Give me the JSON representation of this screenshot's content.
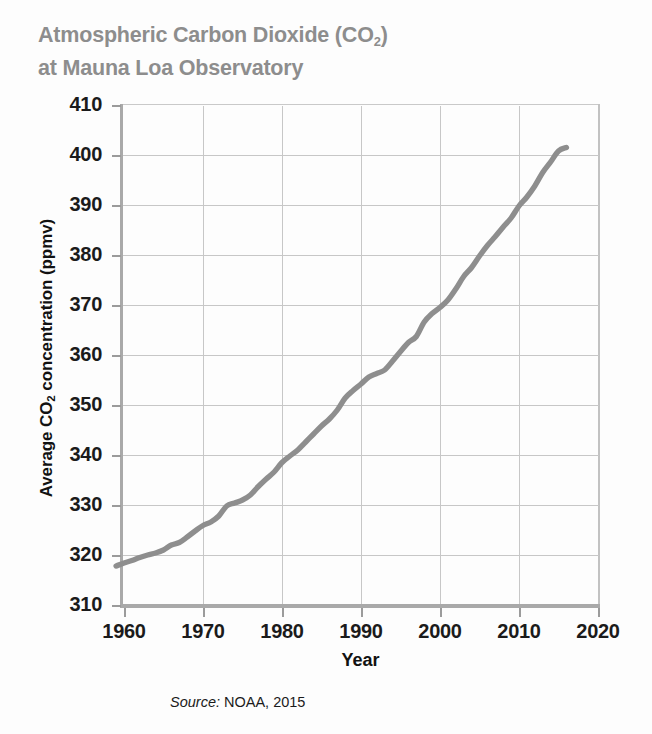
{
  "figure": {
    "title_line1": "Atmospheric Carbon Dioxide (CO",
    "title_sub": "2",
    "title_line1_end": ")",
    "title_line2": "at Mauna Loa Observatory",
    "title_color": "#8d8d8d",
    "background_color": "#fdfdfd",
    "source_label": "Source:",
    "source_value": " NOAA, 2015"
  },
  "axis": {
    "ylabel_pre": "Average CO",
    "ylabel_sub": "2",
    "ylabel_post": " concentration (ppmv)",
    "xlabel": "Year",
    "yticks": [
      "410",
      "400",
      "390",
      "380",
      "370",
      "360",
      "350",
      "340",
      "330",
      "320",
      "310"
    ],
    "xticks": [
      "1960",
      "1970",
      "1980",
      "1990",
      "2000",
      "2010",
      "2020"
    ]
  },
  "chart_data": {
    "type": "line",
    "xlabel": "Year",
    "ylabel": "Average CO2 concentration (ppmv)",
    "xlim": [
      1960,
      2020
    ],
    "ylim": [
      310,
      410
    ],
    "xticks": [
      1960,
      1970,
      1980,
      1990,
      2000,
      2010,
      2020
    ],
    "yticks": [
      310,
      320,
      330,
      340,
      350,
      360,
      370,
      380,
      390,
      400,
      410
    ],
    "grid": true,
    "legend": null,
    "line_color": "#8e8e8e",
    "source": "NOAA, 2015",
    "series": [
      {
        "name": "Average CO2 concentration (ppmv)",
        "x": [
          1959,
          1960,
          1961,
          1962,
          1963,
          1964,
          1965,
          1966,
          1967,
          1968,
          1969,
          1970,
          1971,
          1972,
          1973,
          1974,
          1975,
          1976,
          1977,
          1978,
          1979,
          1980,
          1981,
          1982,
          1983,
          1984,
          1985,
          1986,
          1987,
          1988,
          1989,
          1990,
          1991,
          1992,
          1993,
          1994,
          1995,
          1996,
          1997,
          1998,
          1999,
          2000,
          2001,
          2002,
          2003,
          2004,
          2005,
          2006,
          2007,
          2008,
          2009,
          2010,
          2011,
          2012,
          2013,
          2014,
          2015,
          2016
        ],
        "values": [
          317.8,
          318.4,
          318.9,
          319.5,
          320.0,
          320.4,
          321.0,
          322.0,
          322.5,
          323.6,
          324.8,
          325.9,
          326.6,
          327.8,
          329.8,
          330.4,
          331.0,
          332.0,
          333.7,
          335.2,
          336.6,
          338.5,
          339.8,
          341.0,
          342.6,
          344.2,
          345.8,
          347.2,
          349.0,
          351.4,
          352.9,
          354.2,
          355.6,
          356.3,
          357.0,
          358.8,
          360.7,
          362.5,
          363.7,
          366.6,
          368.3,
          369.5,
          371.0,
          373.2,
          375.7,
          377.5,
          379.8,
          381.9,
          383.7,
          385.6,
          387.4,
          389.8,
          391.6,
          393.8,
          396.5,
          398.6,
          400.8,
          401.5
        ]
      }
    ]
  }
}
